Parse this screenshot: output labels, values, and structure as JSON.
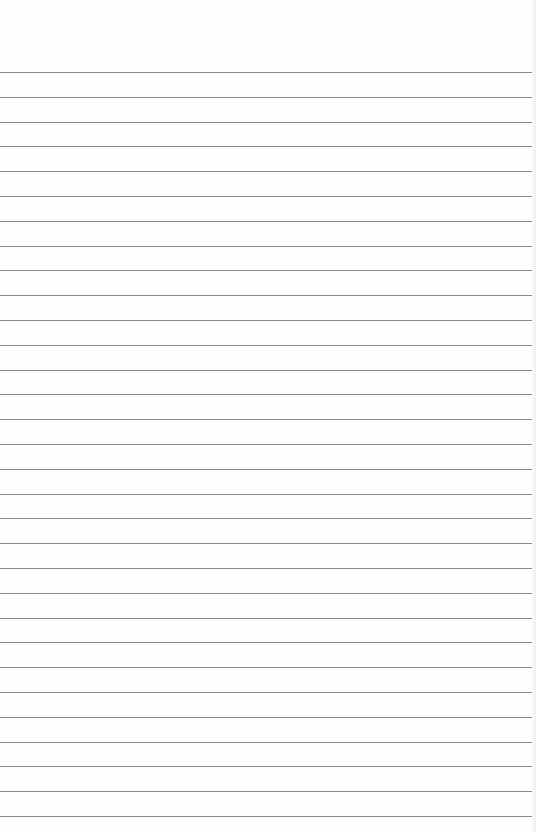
{
  "paper": {
    "type": "lined-paper",
    "background": "#fefefe",
    "line_color": "#8c8c8c",
    "first_line_y": 72,
    "line_spacing": 24.8,
    "line_count": 31
  }
}
